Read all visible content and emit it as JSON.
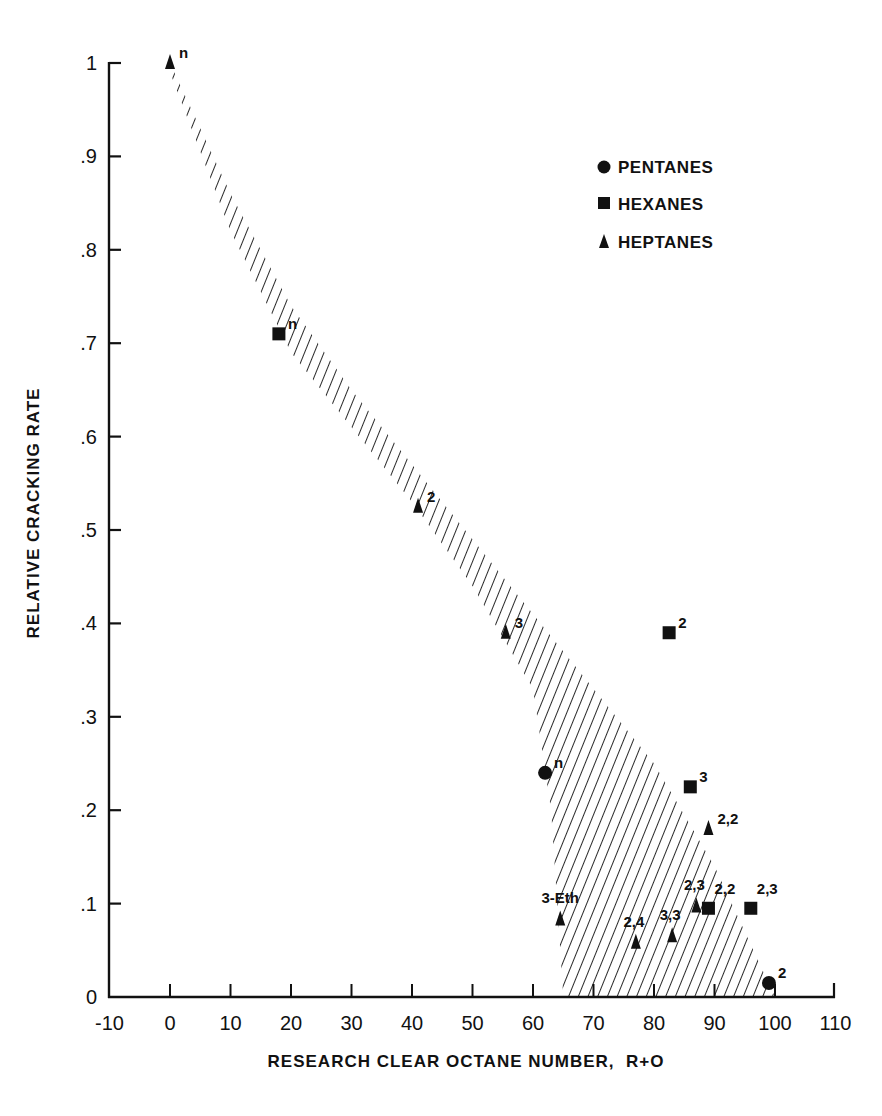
{
  "chart_data": {
    "type": "scatter",
    "title": "",
    "xlabel": "RESEARCH CLEAR OCTANE NUMBER,  R+O",
    "ylabel": "RELATIVE CRACKING RATE",
    "xlim": [
      -10,
      110
    ],
    "ylim": [
      0,
      1.0
    ],
    "grid": false,
    "legend_position": "upper right",
    "x_ticks": [
      -10,
      0,
      10,
      20,
      30,
      40,
      50,
      60,
      70,
      80,
      90,
      100,
      110
    ],
    "x_tick_labels": [
      "-10",
      "0",
      "10",
      "20",
      "30",
      "40",
      "50",
      "60",
      "70",
      "80",
      "90",
      "100",
      "110"
    ],
    "y_ticks": [
      0,
      0.1,
      0.2,
      0.3,
      0.4,
      0.5,
      0.6,
      0.7,
      0.8,
      0.9,
      1.0
    ],
    "y_tick_labels": [
      "0",
      ".1",
      ".2",
      ".3",
      ".4",
      ".5",
      ".6",
      ".7",
      ".8",
      ".9",
      "1"
    ],
    "legend": [
      {
        "name": "PENTANES",
        "marker": "circle"
      },
      {
        "name": "HEXANES",
        "marker": "square"
      },
      {
        "name": "HEPTANES",
        "marker": "triangle"
      }
    ],
    "series": [
      {
        "name": "PENTANES",
        "marker": "circle",
        "points": [
          {
            "label": "n",
            "x": 62,
            "y": 0.24
          },
          {
            "label": "2",
            "x": 99,
            "y": 0.015
          }
        ]
      },
      {
        "name": "HEXANES",
        "marker": "square",
        "points": [
          {
            "label": "n",
            "x": 18,
            "y": 0.71
          },
          {
            "label": "2",
            "x": 82.5,
            "y": 0.39
          },
          {
            "label": "3",
            "x": 86,
            "y": 0.225
          },
          {
            "label": "2,2",
            "x": 89,
            "y": 0.095
          },
          {
            "label": "2,3",
            "x": 96,
            "y": 0.095
          }
        ]
      },
      {
        "name": "HEPTANES",
        "marker": "triangle",
        "points": [
          {
            "label": "n",
            "x": 0,
            "y": 1.0
          },
          {
            "label": "2",
            "x": 41,
            "y": 0.525
          },
          {
            "label": "3",
            "x": 55.5,
            "y": 0.39
          },
          {
            "label": "2,2",
            "x": 89,
            "y": 0.18
          },
          {
            "label": "2,3",
            "x": 87,
            "y": 0.097
          },
          {
            "label": "3,3",
            "x": 83,
            "y": 0.065
          },
          {
            "label": "2,4",
            "x": 77,
            "y": 0.058
          },
          {
            "label": "3-Eth",
            "x": 64.5,
            "y": 0.083
          }
        ]
      }
    ],
    "annotations": [
      {
        "type": "hatched_band",
        "description": "Diagonally hatched correlation band running from (0, 1.0) down to roughly x=65–100 at y=0",
        "upper_edge": [
          [
            0,
            1.0
          ],
          [
            10,
            0.86
          ],
          [
            20,
            0.74
          ],
          [
            30,
            0.65
          ],
          [
            40,
            0.57
          ],
          [
            50,
            0.49
          ],
          [
            60,
            0.41
          ],
          [
            70,
            0.33
          ],
          [
            80,
            0.25
          ],
          [
            90,
            0.14
          ],
          [
            100,
            0.0
          ]
        ],
        "lower_edge": [
          [
            0,
            0.99
          ],
          [
            10,
            0.82
          ],
          [
            20,
            0.69
          ],
          [
            30,
            0.61
          ],
          [
            40,
            0.53
          ],
          [
            50,
            0.44
          ],
          [
            60,
            0.33
          ],
          [
            63,
            0.2
          ],
          [
            65,
            0.0
          ]
        ]
      }
    ]
  },
  "axes": {
    "x_title": "RESEARCH CLEAR OCTANE NUMBER,  R+O",
    "y_title": "RELATIVE CRACKING RATE"
  },
  "legend": {
    "items": [
      "PENTANES",
      "HEXANES",
      "HEPTANES"
    ]
  }
}
